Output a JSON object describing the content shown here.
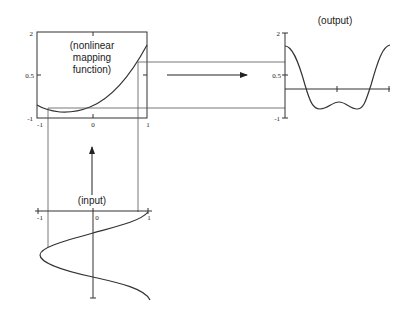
{
  "diagram": {
    "mapping": {
      "label_lines": [
        "(nonlinear",
        "mapping",
        "function)"
      ],
      "y_ticks": [
        "2",
        "0.5",
        "-1"
      ],
      "x_ticks": [
        "-1",
        "0",
        "1"
      ]
    },
    "output": {
      "label": "(output)",
      "y_ticks": [
        "2",
        "0.5",
        "-1"
      ]
    },
    "input": {
      "label": "(input)",
      "x_ticks": [
        "-1",
        "0",
        "1"
      ]
    },
    "colors": {
      "stroke": "#333333",
      "background": "#ffffff"
    }
  }
}
